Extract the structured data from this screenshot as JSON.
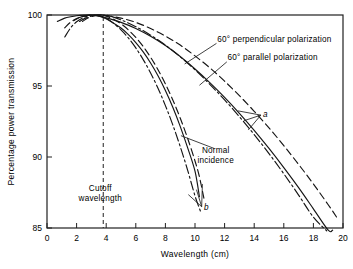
{
  "chart_data": {
    "type": "line",
    "title": "",
    "xlabel": "Wavelength (cm)",
    "ylabel": "Percentage power transmission",
    "xlim": [
      0,
      20
    ],
    "ylim": [
      85,
      100
    ],
    "xticks": [
      0,
      2,
      4,
      6,
      8,
      10,
      12,
      14,
      16,
      18,
      20
    ],
    "yticks": [
      85,
      90,
      95,
      100
    ],
    "grid": false,
    "legend_position": "inline-annotations",
    "annotations": [
      {
        "text": "60° perpendicular polarization",
        "x": 11.5,
        "y": 98.1
      },
      {
        "text": "60° parallel polarization",
        "x": 12.2,
        "y": 96.8
      },
      {
        "text": "Normal incidence",
        "x": 11.4,
        "y": 90.3
      },
      {
        "text": "Cutoff wavelength",
        "x": 3.8,
        "y": 87.6
      },
      {
        "text": "a",
        "x": 14.6,
        "y": 92.8
      },
      {
        "text": "b",
        "x": 10.6,
        "y": 86.3
      }
    ],
    "cutoff_wavelength": 3.8,
    "series": [
      {
        "name": "60° perpendicular polarization (group a)",
        "group": "a",
        "style": "dashed",
        "x": [
          1.2,
          1.6,
          2.0,
          2.5,
          3.0,
          3.5,
          4.0,
          5.0,
          6.0,
          7.0,
          8.0,
          9.0,
          10.0,
          11.0,
          12.0,
          13.0,
          14.0,
          15.0,
          16.0,
          17.0,
          18.0,
          19.0,
          19.6
        ],
        "y": [
          99.1,
          99.5,
          99.75,
          99.92,
          99.99,
          100.0,
          99.96,
          99.78,
          99.48,
          99.05,
          98.52,
          97.88,
          97.12,
          96.28,
          95.34,
          94.32,
          93.22,
          92.05,
          90.8,
          89.48,
          88.1,
          86.64,
          85.72
        ]
      },
      {
        "name": "Normal incidence (group a)",
        "group": "a",
        "style": "solid",
        "x": [
          0.7,
          1.2,
          1.6,
          2.0,
          2.5,
          3.0,
          3.5,
          4.0,
          5.0,
          6.0,
          7.0,
          8.0,
          9.0,
          10.0,
          11.0,
          12.0,
          13.0,
          14.0,
          15.0,
          16.0,
          17.0,
          18.0,
          19.0,
          19.3
        ],
        "y": [
          99.55,
          99.78,
          99.88,
          99.95,
          99.99,
          100.0,
          99.92,
          99.8,
          99.48,
          99.05,
          98.5,
          97.85,
          97.08,
          96.2,
          95.24,
          94.2,
          93.08,
          91.88,
          90.6,
          89.25,
          87.84,
          86.35,
          84.85,
          84.85
        ]
      },
      {
        "name": "60° parallel polarization (group a)",
        "group": "a",
        "style": "dashdot",
        "x": [
          2.2,
          2.6,
          3.0,
          3.4,
          3.8,
          4.2,
          5.0,
          6.0,
          7.0,
          8.0,
          9.0,
          10.0,
          11.0,
          12.0,
          13.0,
          14.0,
          15.0,
          16.0,
          17.0,
          18.0,
          18.9
        ],
        "y": [
          99.55,
          99.78,
          99.92,
          99.99,
          100.0,
          99.94,
          99.66,
          99.18,
          98.58,
          97.88,
          97.06,
          96.14,
          95.12,
          94.02,
          92.84,
          91.58,
          90.24,
          88.82,
          87.32,
          85.76,
          84.8
        ]
      },
      {
        "name": "60° perpendicular polarization (group b)",
        "group": "b",
        "style": "dashed",
        "x": [
          2.4,
          2.8,
          3.2,
          3.6,
          4.0,
          4.5,
          5.0,
          5.5,
          6.0,
          6.5,
          7.0,
          7.5,
          8.0,
          8.5,
          9.0,
          9.5,
          10.0,
          10.3,
          10.6
        ],
        "y": [
          99.55,
          99.8,
          99.94,
          99.99,
          99.92,
          99.7,
          99.38,
          98.95,
          98.42,
          97.78,
          97.02,
          96.15,
          95.15,
          94.02,
          92.75,
          91.32,
          89.72,
          88.6,
          87.1
        ]
      },
      {
        "name": "Normal incidence (group b)",
        "group": "b",
        "style": "solid",
        "x": [
          1.8,
          2.2,
          2.6,
          3.0,
          3.4,
          3.8,
          4.2,
          5.0,
          5.5,
          6.0,
          6.5,
          7.0,
          7.5,
          8.0,
          8.5,
          9.0,
          9.5,
          10.0,
          10.3
        ],
        "y": [
          99.6,
          99.82,
          99.94,
          100.0,
          99.96,
          99.82,
          99.62,
          99.08,
          98.62,
          98.06,
          97.4,
          96.62,
          95.72,
          94.68,
          93.5,
          92.16,
          90.66,
          89.0,
          87.2
        ]
      },
      {
        "name": "60° parallel polarization (group b)",
        "group": "b",
        "style": "dashdot",
        "x": [
          1.2,
          1.6,
          2.0,
          2.4,
          2.8,
          3.2,
          3.6,
          4.0,
          4.4,
          5.0,
          5.5,
          6.0,
          6.5,
          7.0,
          7.5,
          8.0,
          8.5,
          9.0,
          9.5,
          10.0,
          10.4
        ],
        "y": [
          98.45,
          99.1,
          99.52,
          99.78,
          99.93,
          99.99,
          99.94,
          99.75,
          99.5,
          98.95,
          98.38,
          97.68,
          96.86,
          95.92,
          94.84,
          93.62,
          92.26,
          90.74,
          89.08,
          87.26,
          86.1
        ]
      }
    ]
  },
  "axes": {
    "xlabel": "Wavelength (cm)",
    "ylabel": "Percentage power transmission"
  }
}
